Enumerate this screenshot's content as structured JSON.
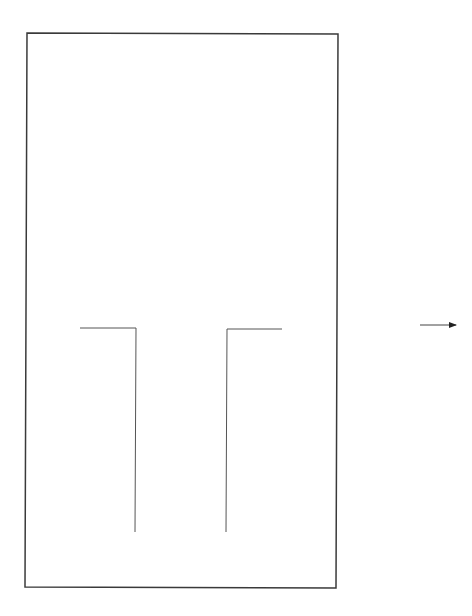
{
  "figure": {
    "type": "line-drawing",
    "background": "#ffffff",
    "stroke_color": "#3a3a3a",
    "inner_stroke_color": "#555555",
    "frame": {
      "corners": {
        "top_left": [
          27,
          33
        ],
        "top_right": [
          338,
          34
        ],
        "bottom_right": [
          336,
          588
        ],
        "bottom_left": [
          25,
          587
        ]
      },
      "stroke_width": 1.5
    },
    "left_bracket": {
      "points": [
        [
          80,
          328
        ],
        [
          136,
          328
        ],
        [
          135,
          532
        ]
      ],
      "stroke_width": 1
    },
    "right_bracket": {
      "points": [
        [
          282,
          329
        ],
        [
          227,
          329
        ],
        [
          226,
          532
        ]
      ],
      "stroke_width": 1
    },
    "arrow": {
      "from": [
        420,
        325
      ],
      "to": [
        462,
        325
      ],
      "direction": "right",
      "stroke_width": 1
    }
  }
}
